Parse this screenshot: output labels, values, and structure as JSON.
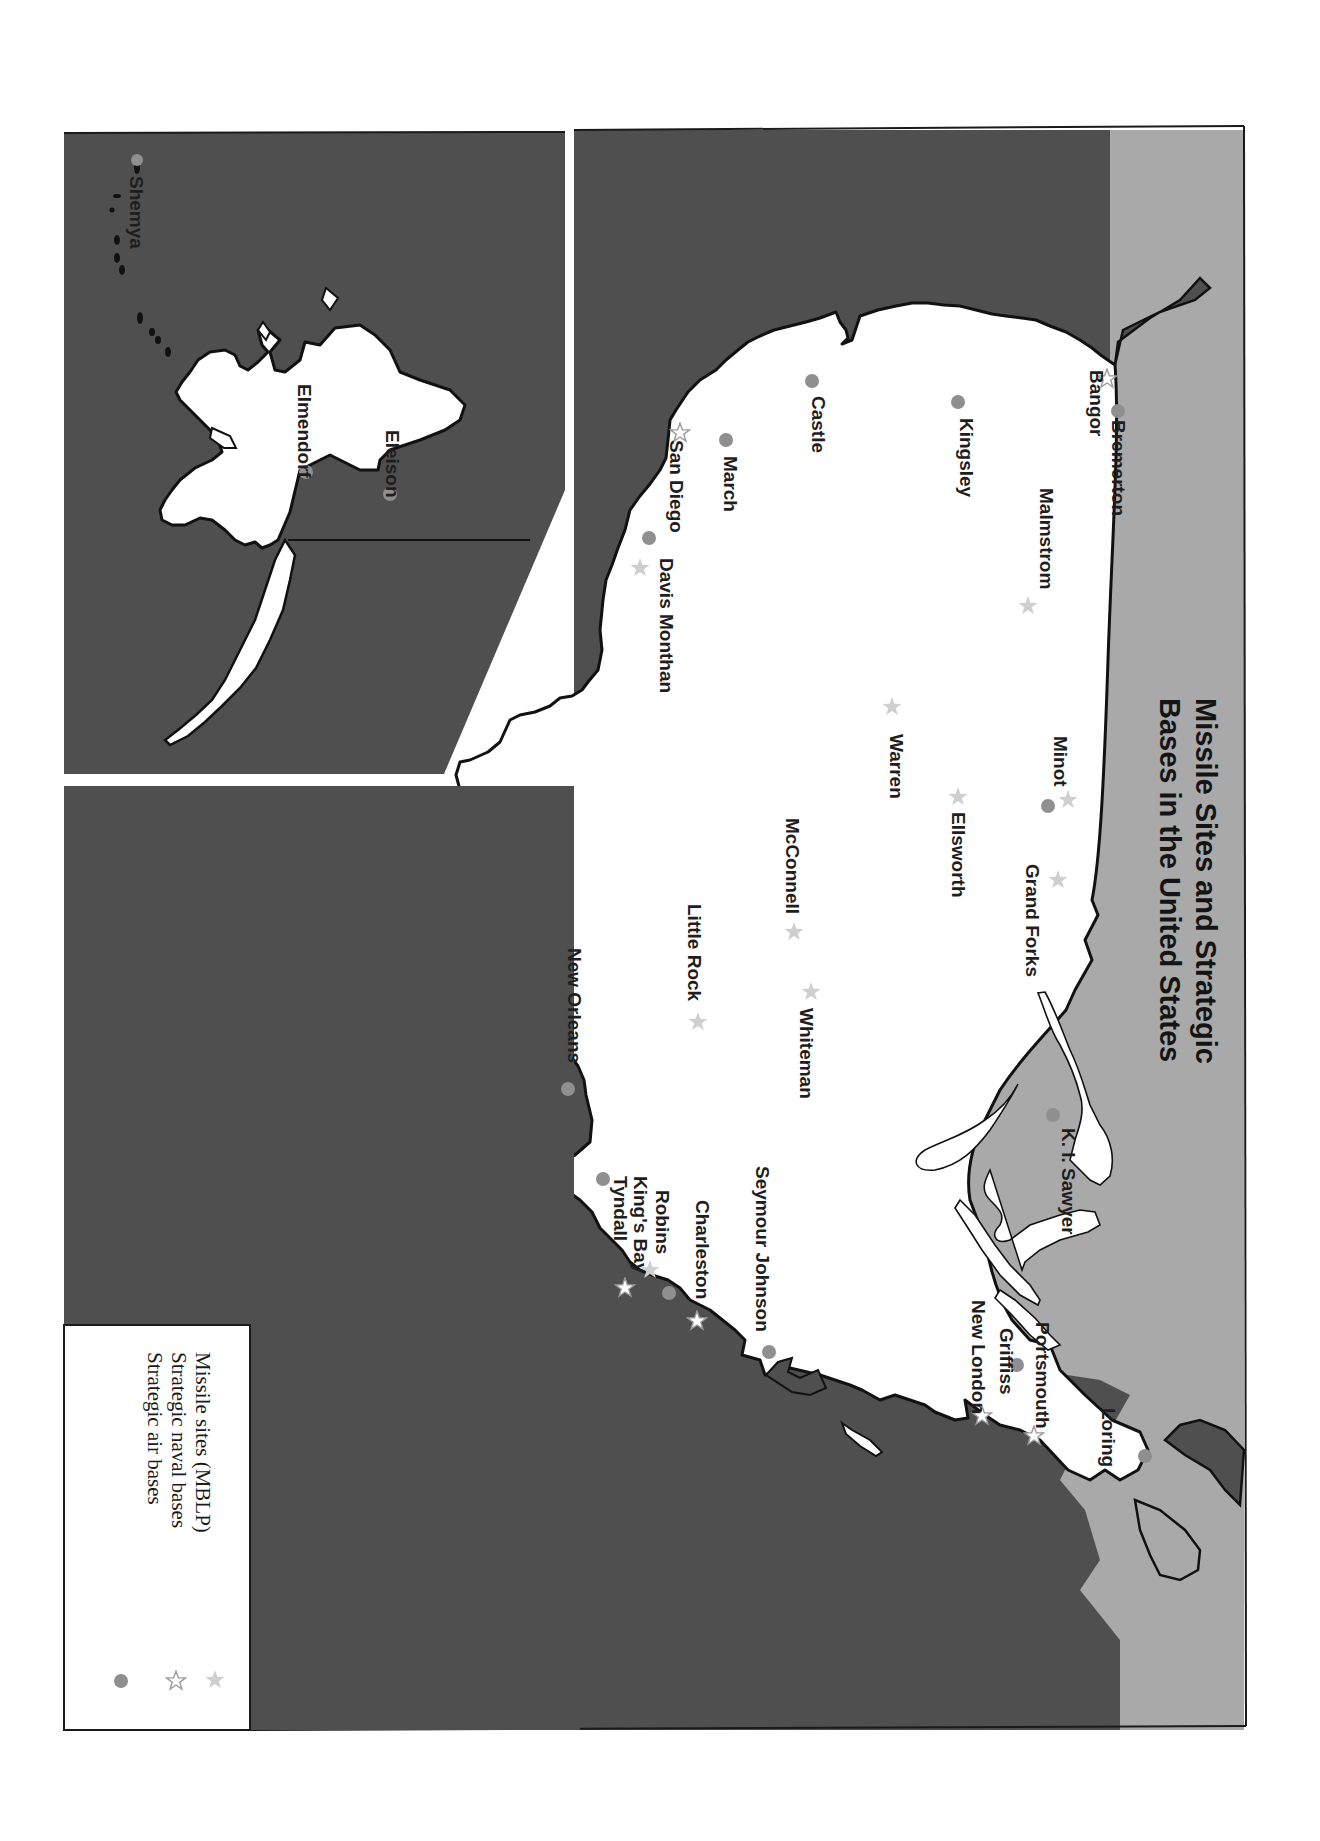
{
  "title": {
    "line1": "Missile Sites and Strategic",
    "line2": "Bases in the United States"
  },
  "legend": {
    "items": [
      {
        "label": "Missile sites (MBLP)",
        "symbol": "filled-star",
        "color": "#c8c8c8"
      },
      {
        "label": "Strategic naval bases",
        "symbol": "outline-star",
        "color": "#9a9a9a"
      },
      {
        "label": "Strategic air bases",
        "symbol": "filled-circle",
        "color": "#8f8f8f"
      }
    ]
  },
  "colors": {
    "ocean": "#4f4f4f",
    "canada": "#a9a9a9",
    "land": "#ffffff",
    "coastline": "#111111",
    "air_base": "#8f8f8f",
    "missile_site": "#cfcfcf",
    "naval_base": "#9a9a9a"
  },
  "inset": {
    "name": "Alaska",
    "labels": {
      "shemya": "Shemya",
      "elmendorf": "Elmendorf",
      "eleison": "Eleison"
    }
  },
  "labels": {
    "bremerton": "Bremerton",
    "bangor": "Bangor",
    "malmstrom": "Malmstrom",
    "kingsley": "Kingsley",
    "castle": "Castle",
    "march": "March",
    "san_diego": "San Diego",
    "davis_monthan": "Davis Monthan",
    "minot": "Minot",
    "warren": "Warren",
    "ellsworth": "Ellsworth",
    "grand_forks": "Grand Forks",
    "mcconnell": "McConnell",
    "little_rock": "Little Rock",
    "whiteman": "Whiteman",
    "new_orleans": "New Orleans",
    "k_i_sawyer": "K. I. Sawyer",
    "seymour_johnson": "Seymour Johnson",
    "charleston": "Charleston",
    "robins": "Robins",
    "kings_bay": "King's Bay",
    "tyndall": "Tyndall",
    "portsmouth": "Portsmouth",
    "griffiss": "Griffiss",
    "new_london": "New London",
    "loring": "Loring"
  },
  "bases": {
    "air_bases": [
      "Bremerton",
      "Kingsley",
      "Castle",
      "March",
      "Davis Monthan",
      "Minot",
      "New Orleans",
      "K. I. Sawyer",
      "Seymour Johnson",
      "Charleston",
      "Tyndall",
      "Griffiss",
      "Loring",
      "Shemya",
      "Elmendorf",
      "Eleison"
    ],
    "naval_bases": [
      "Bangor",
      "San Diego",
      "Charleston",
      "King's Bay",
      "Portsmouth",
      "New London"
    ],
    "missile_sites": [
      "Malmstrom",
      "Davis Monthan",
      "Minot",
      "Warren",
      "Ellsworth",
      "Grand Forks",
      "McConnell",
      "Little Rock",
      "Whiteman",
      "Robins"
    ]
  }
}
